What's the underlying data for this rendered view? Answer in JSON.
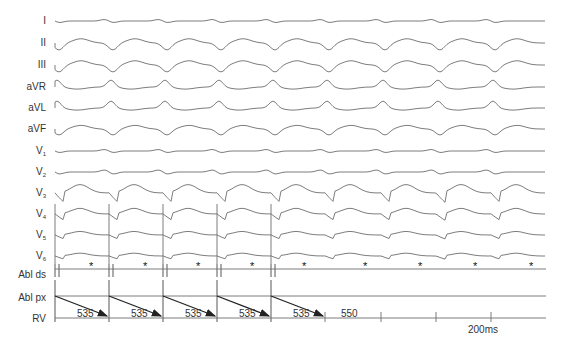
{
  "figure": {
    "leads": [
      {
        "id": "I",
        "label": "I",
        "y": 49
      },
      {
        "id": "II",
        "label": "II",
        "y": 71
      },
      {
        "id": "III",
        "label": "III",
        "y": 93
      },
      {
        "id": "aVR",
        "label": "aVR",
        "y": 114
      },
      {
        "id": "aVL",
        "label": "aVL",
        "y": 134
      },
      {
        "id": "aVF",
        "label": "aVF",
        "y": 156
      },
      {
        "id": "V1",
        "label": "V",
        "sub": "1",
        "y": 176
      },
      {
        "id": "V2",
        "label": "V",
        "sub": "2",
        "y": 197
      },
      {
        "id": "V3",
        "label": "V",
        "sub": "3",
        "y": 217
      },
      {
        "id": "V4",
        "label": "V",
        "sub": "4",
        "y": 238
      },
      {
        "id": "V5",
        "label": "V",
        "sub": "5",
        "y": 258
      },
      {
        "id": "V6",
        "label": "V",
        "sub": "6",
        "y": 278
      },
      {
        "id": "Abl_ds",
        "label": "Abl ds",
        "y": 293
      },
      {
        "id": "Abl_px",
        "label": "Abl px",
        "y": 296
      },
      {
        "id": "RV",
        "label": "RV",
        "y": 318
      }
    ],
    "pacing_intervals": [
      {
        "label": "535"
      },
      {
        "label": "535"
      },
      {
        "label": "535"
      },
      {
        "label": "535"
      },
      {
        "label": "535"
      }
    ],
    "return_interval": {
      "label": "550"
    },
    "marker_symbol": "*",
    "scale_bar": {
      "label": "200ms"
    },
    "colors": {
      "trace": "#6e6e6e",
      "arrow": "#222222",
      "text": "#333333"
    }
  }
}
